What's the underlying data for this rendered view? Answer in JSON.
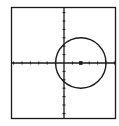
{
  "chart_data": {
    "type": "line",
    "title": "",
    "xlabel": "",
    "ylabel": "",
    "xlim": [
      -6,
      6
    ],
    "ylim": [
      -6,
      6
    ],
    "grid": false,
    "tick_spacing": 1,
    "series": [
      {
        "name": "circle",
        "shape": "circle",
        "center": [
          2,
          0
        ],
        "radius": 3
      }
    ],
    "points": [
      {
        "name": "center",
        "x": 2,
        "y": 0
      }
    ]
  },
  "colors": {
    "background": "#ffffff",
    "ink": "#1a1a1a"
  }
}
